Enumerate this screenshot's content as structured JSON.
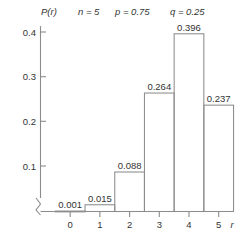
{
  "chart_data": {
    "type": "bar",
    "title": "",
    "subtitle": "",
    "xlabel": "r",
    "ylabel": "P(r)",
    "categories": [
      "0",
      "1",
      "2",
      "3",
      "4",
      "5"
    ],
    "values": [
      0.001,
      0.015,
      0.088,
      0.264,
      0.396,
      0.237
    ],
    "data_labels": [
      "0.001",
      "0.015",
      "0.088",
      "0.264",
      "0.396",
      "0.237"
    ],
    "xlim": [
      -0.5,
      5.5
    ],
    "ylim": [
      0,
      0.44
    ],
    "ytick_labels": [
      "0.1",
      "0.2",
      "0.3",
      "0.4"
    ],
    "ytick_values": [
      0.1,
      0.2,
      0.3,
      0.4
    ],
    "xtick_labels": [
      "0",
      "1",
      "2",
      "3",
      "4",
      "5"
    ],
    "grid": false,
    "legend": false,
    "axis_break": true,
    "bar_fill": "none",
    "bar_stroke": "#8c8c8c",
    "text_color": "#333333",
    "background": "#ffffff",
    "annotations": {
      "n": "n = 5",
      "p": "p = 0.75",
      "q": "q = 0.25"
    }
  }
}
